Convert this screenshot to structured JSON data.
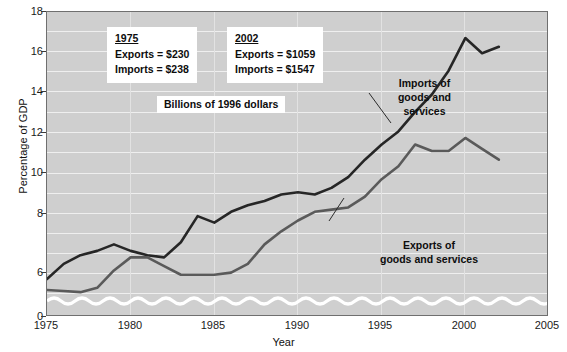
{
  "chart_data": {
    "type": "line",
    "title": "",
    "xlabel": "Year",
    "ylabel": "Percentage of GDP",
    "xlim": [
      1975,
      2005
    ],
    "ylim": [
      4.6,
      18
    ],
    "yticks": [
      18,
      16,
      14,
      12,
      10,
      8,
      6,
      0
    ],
    "xticks": [
      1975,
      1980,
      1985,
      1990,
      1995,
      2000,
      2005
    ],
    "grid": true,
    "axis_break": "y-axis broken between 0 and 6 (wavy break line)",
    "legend_position": "inline annotations on lines",
    "series": [
      {
        "name": "Imports of goods and services",
        "color": "#262626",
        "x": [
          1975,
          1976,
          1977,
          1978,
          1979,
          1980,
          1981,
          1982,
          1983,
          1984,
          1985,
          1986,
          1987,
          1988,
          1989,
          1990,
          1991,
          1992,
          1993,
          1994,
          1995,
          1996,
          1997,
          1998,
          1999,
          2000,
          2001,
          2002
        ],
        "values": [
          5.7,
          6.4,
          6.8,
          7.0,
          7.3,
          7.0,
          6.8,
          6.7,
          7.4,
          8.6,
          8.3,
          8.8,
          9.1,
          9.3,
          9.6,
          9.7,
          9.6,
          9.9,
          10.4,
          11.2,
          11.9,
          12.5,
          13.4,
          14.2,
          15.3,
          16.8,
          16.1,
          16.4
        ]
      },
      {
        "name": "Exports of goods and services",
        "color": "#5a5a5a",
        "x": [
          1975,
          1976,
          1977,
          1978,
          1979,
          1980,
          1981,
          1982,
          1983,
          1984,
          1985,
          1986,
          1987,
          1988,
          1989,
          1990,
          1991,
          1992,
          1993,
          1994,
          1995,
          1996,
          1997,
          1998,
          1999,
          2000,
          2001,
          2002
        ],
        "values": [
          5.2,
          5.15,
          5.1,
          5.3,
          6.1,
          6.7,
          6.7,
          6.3,
          5.9,
          5.9,
          5.9,
          6.0,
          6.4,
          7.3,
          7.9,
          8.4,
          8.8,
          8.9,
          9.0,
          9.5,
          10.3,
          10.9,
          11.9,
          11.6,
          11.6,
          12.2,
          11.7,
          11.2
        ]
      }
    ],
    "annotations": [
      {
        "name": "1975-data-box",
        "year": "1975",
        "exports": "Exports  =  $230",
        "imports": "Imports  =  $238"
      },
      {
        "name": "2002-data-box",
        "year": "2002",
        "exports": "Exports  =  $1059",
        "imports": "Imports  =  $1547"
      },
      {
        "name": "units-note",
        "text": "Billions of 1996 dollars"
      },
      {
        "name": "imports-line-label",
        "line1": "Imports of",
        "line2": "goods and",
        "line3": "services"
      },
      {
        "name": "exports-line-label",
        "line1": "Exports of",
        "line2": "goods and services"
      }
    ],
    "tick_labels": {
      "y": [
        "18",
        "16",
        "14",
        "12",
        "10",
        "8",
        "6",
        "0"
      ],
      "x": [
        "1975",
        "1980",
        "1985",
        "1990",
        "1995",
        "2000",
        "2005"
      ]
    }
  },
  "colors": {
    "plot_background": "#cfcfcf",
    "gridline": "#efefef",
    "imports_line": "#262626",
    "exports_line": "#5a5a5a",
    "frame": "#6f6f6f",
    "box_background": "#ffffff"
  }
}
